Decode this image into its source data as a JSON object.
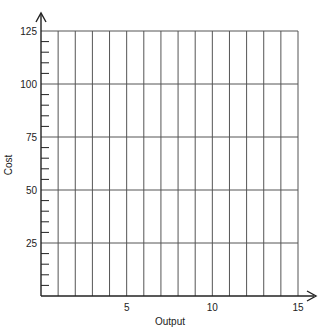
{
  "chart_data": {
    "type": "line",
    "title": "",
    "xlabel": "Output",
    "ylabel": "Cost",
    "xlim": [
      0,
      15
    ],
    "ylim": [
      0,
      125
    ],
    "x_ticks": [
      5,
      10,
      15
    ],
    "y_ticks": [
      25,
      50,
      75,
      100,
      125
    ],
    "x_tick_labels": [
      "5",
      "10",
      "15"
    ],
    "y_tick_labels": [
      "25",
      "50",
      "75",
      "100",
      "125"
    ],
    "x_grid_step": 1,
    "y_grid_major_step": 25,
    "y_minor_tick_step": 5,
    "grid": true,
    "series": [],
    "legend": null
  },
  "colors": {
    "axis": "#222222",
    "grid": "#555555"
  }
}
